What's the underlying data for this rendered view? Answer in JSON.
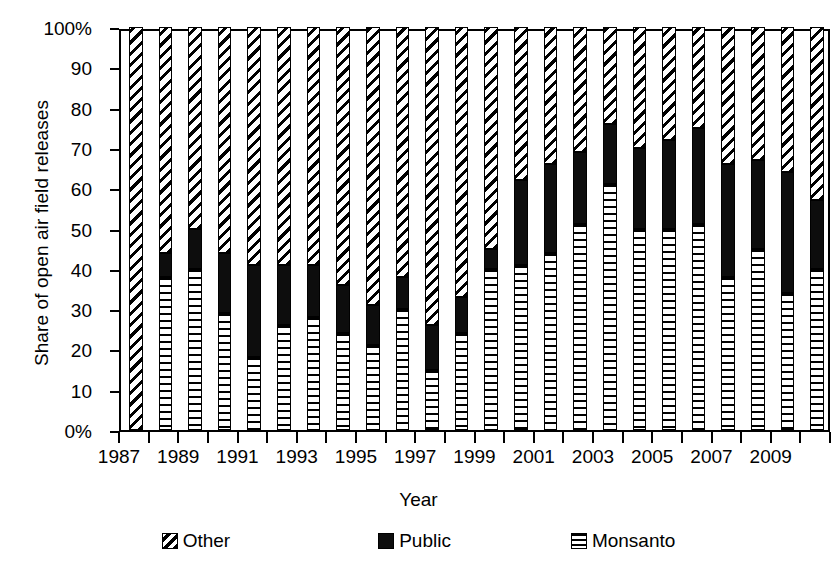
{
  "chart_data": {
    "type": "bar",
    "subtype": "stacked-percentage",
    "title": "",
    "xlabel": "Year",
    "ylabel": "Share of open air field releases",
    "ylim": [
      0,
      100
    ],
    "yticks": [
      0,
      10,
      20,
      30,
      40,
      50,
      60,
      70,
      80,
      90,
      100
    ],
    "ytick_labels": [
      "0%",
      "10",
      "20",
      "30",
      "40",
      "50",
      "60",
      "70",
      "80",
      "90",
      "100%"
    ],
    "xlim": [
      1987,
      2010
    ],
    "xtick_labels": [
      "1987",
      "1989",
      "1991",
      "1993",
      "1995",
      "1997",
      "1999",
      "2001",
      "2003",
      "2005",
      "2007",
      "2009"
    ],
    "grid": false,
    "legend_position": "bottom",
    "legend": [
      "Other",
      "Public",
      "Monsanto"
    ],
    "categories": [
      1987,
      1988,
      1989,
      1990,
      1991,
      1992,
      1993,
      1994,
      1995,
      1996,
      1997,
      1998,
      1999,
      2000,
      2001,
      2002,
      2003,
      2004,
      2005,
      2006,
      2007,
      2008,
      2009,
      2010
    ],
    "series": [
      {
        "name": "Monsanto",
        "color": "#ffffff",
        "pattern": "horizontal-lines",
        "values": [
          0,
          38,
          40,
          29,
          18,
          26,
          28,
          24,
          21,
          30,
          15,
          24,
          40,
          41,
          44,
          51,
          61,
          50,
          50,
          51,
          38,
          45,
          34,
          40
        ]
      },
      {
        "name": "Public",
        "color": "#000000",
        "pattern": "solid",
        "values": [
          0,
          6,
          10,
          15,
          23,
          15,
          13,
          12,
          10,
          8,
          11,
          9,
          5,
          21,
          22,
          18,
          15,
          20,
          22,
          24,
          28,
          22,
          30,
          17
        ]
      },
      {
        "name": "Other",
        "color": "#ffffff",
        "pattern": "diagonal-hatch",
        "values": [
          100,
          56,
          50,
          56,
          59,
          59,
          59,
          64,
          69,
          62,
          74,
          67,
          55,
          38,
          34,
          31,
          24,
          30,
          28,
          25,
          34,
          33,
          36,
          43
        ]
      }
    ],
    "stack_tops": {
      "monsanto": [
        0,
        38,
        40,
        29,
        18,
        26,
        28,
        24,
        21,
        30,
        15,
        24,
        40,
        41,
        44,
        51,
        61,
        50,
        50,
        51,
        38,
        45,
        34,
        40
      ],
      "public": [
        0,
        44,
        50,
        44,
        41,
        41,
        41,
        36,
        31,
        38,
        26,
        33,
        45,
        62,
        66,
        69,
        76,
        70,
        72,
        75,
        66,
        67,
        64,
        57
      ],
      "other": [
        100,
        100,
        100,
        100,
        100,
        100,
        100,
        100,
        100,
        100,
        100,
        100,
        100,
        100,
        100,
        100,
        100,
        100,
        100,
        100,
        100,
        100,
        100,
        100
      ]
    }
  },
  "legend": {
    "items": [
      {
        "label": "Other",
        "swatch": "diagonal-hatch-swatch"
      },
      {
        "label": "Public",
        "swatch": "solid-black-swatch"
      },
      {
        "label": "Monsanto",
        "swatch": "horizontal-lines-swatch"
      }
    ]
  },
  "axes": {
    "y_title": "Share of open air field releases",
    "x_title": "Year"
  }
}
